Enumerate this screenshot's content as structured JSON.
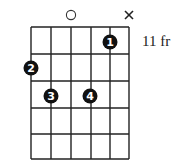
{
  "diagram": {
    "type": "chord-chart",
    "strings": 6,
    "frets_shown": 5,
    "position_label": "11 fr",
    "grid": {
      "string_x": [
        31,
        51,
        71,
        91,
        110,
        129
      ],
      "fret_y": [
        27,
        54,
        81,
        108,
        134,
        159
      ],
      "line_color": "#222222"
    },
    "open_strings": [
      {
        "string": 3,
        "symbol": "○",
        "label": "open"
      }
    ],
    "muted_strings": [
      {
        "string": 6,
        "symbol": "X",
        "label": "muted"
      }
    ],
    "fingers": [
      {
        "finger": "1",
        "string": 5,
        "fret": 1,
        "x": 110,
        "y": 42
      },
      {
        "finger": "2",
        "string": 1,
        "fret": 2,
        "x": 31,
        "y": 68
      },
      {
        "finger": "3",
        "string": 2,
        "fret": 3,
        "x": 51,
        "y": 96
      },
      {
        "finger": "4",
        "string": 4,
        "fret": 3,
        "x": 90,
        "y": 96
      }
    ],
    "dot_color": "#111111",
    "dot_text_color": "#ffffff"
  }
}
